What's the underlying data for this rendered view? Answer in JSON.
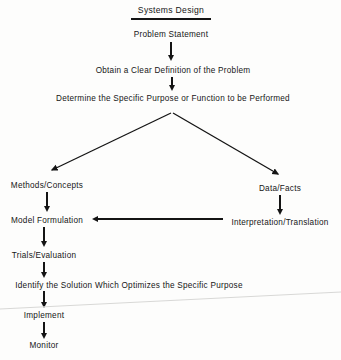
{
  "diagram": {
    "title": "Systems Design",
    "nodes": [
      {
        "id": "title",
        "label": "Systems Design",
        "x": 171,
        "y": 5,
        "underline": true
      },
      {
        "id": "problem",
        "label": "Problem Statement",
        "x": 171,
        "y": 30
      },
      {
        "id": "obtain",
        "label": "Obtain a Clear Definition of the Problem",
        "x": 173,
        "y": 66
      },
      {
        "id": "determine",
        "label": "Determine the Specific Purpose or Function to be Performed",
        "x": 173,
        "y": 94
      },
      {
        "id": "methods",
        "label": "Methods/Concepts",
        "x": 47,
        "y": 181
      },
      {
        "id": "data",
        "label": "Data/Facts",
        "x": 280,
        "y": 184
      },
      {
        "id": "model",
        "label": "Model Formulation",
        "x": 47,
        "y": 216
      },
      {
        "id": "interpretation",
        "label": "Interpretation/Translation",
        "x": 280,
        "y": 218
      },
      {
        "id": "trials",
        "label": "Trials/Evaluation",
        "x": 44,
        "y": 251
      },
      {
        "id": "identify",
        "label": "Identify the Solution Which Optimizes the Specific Purpose",
        "x": 129,
        "y": 281
      },
      {
        "id": "implement",
        "label": "Implement",
        "x": 44,
        "y": 311
      },
      {
        "id": "monitor",
        "label": "Monitor",
        "x": 44,
        "y": 341
      }
    ],
    "arrows": [
      {
        "id": "problem-to-obtain",
        "type": "vertical",
        "x": 171,
        "y": 42,
        "length": 19
      },
      {
        "id": "obtain-to-determine",
        "type": "vertical",
        "x": 172,
        "y": 77,
        "length": 14
      },
      {
        "id": "methods-to-model",
        "type": "vertical",
        "x": 47,
        "y": 192,
        "length": 20
      },
      {
        "id": "data-to-interpretation",
        "type": "vertical",
        "x": 280,
        "y": 195,
        "length": 20
      },
      {
        "id": "model-to-trials",
        "type": "vertical",
        "x": 44,
        "y": 227,
        "length": 20
      },
      {
        "id": "trials-to-identify",
        "type": "vertical",
        "x": 44,
        "y": 262,
        "length": 16
      },
      {
        "id": "identify-to-implement",
        "type": "vertical",
        "x": 44,
        "y": 291,
        "length": 17
      },
      {
        "id": "implement-to-monitor",
        "type": "vertical",
        "x": 44,
        "y": 322,
        "length": 17
      },
      {
        "id": "interpretation-to-model",
        "type": "horizontal",
        "x": 92,
        "y": 219,
        "length": 131
      },
      {
        "id": "determine-to-methods",
        "type": "branch-left",
        "x1": 171,
        "y1": 113,
        "x2": 49,
        "y2": 172
      },
      {
        "id": "determine-to-data",
        "type": "branch-right",
        "x1": 173,
        "y1": 113,
        "x2": 281,
        "y2": 176
      }
    ],
    "artifact": {
      "id": "scan-line",
      "x1": 0,
      "y1": 309,
      "x2": 341,
      "y2": 292
    }
  },
  "colors": {
    "ink": "#141414",
    "background": "#fdfdfc",
    "artifact": "#d8d8d6"
  }
}
